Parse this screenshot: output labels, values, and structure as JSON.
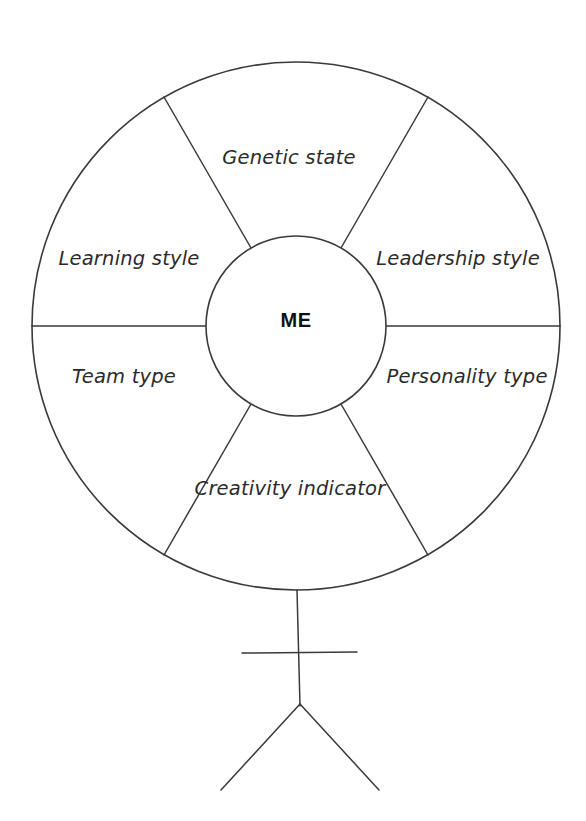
{
  "diagram": {
    "type": "radial-wheel",
    "top_caption": "",
    "center": {
      "label": "ME"
    },
    "sectors": [
      {
        "id": "genetic-state",
        "label": "Genetic state",
        "position": "top",
        "label_x": 289,
        "label_y": 158
      },
      {
        "id": "leadership-style",
        "label": "Leadership style",
        "position": "upper-right",
        "label_x": 458,
        "label_y": 259
      },
      {
        "id": "personality-type",
        "label": "Personality type",
        "position": "lower-right",
        "label_x": 467,
        "label_y": 377
      },
      {
        "id": "creativity-indicator",
        "label": "Creativity indicator",
        "position": "bottom",
        "label_x": 290,
        "label_y": 489
      },
      {
        "id": "team-type",
        "label": "Team type",
        "position": "lower-left",
        "label_x": 124,
        "label_y": 377
      },
      {
        "id": "learning-style",
        "label": "Learning style",
        "position": "upper-left",
        "label_x": 129,
        "label_y": 259
      }
    ],
    "geometry": {
      "outer_circle": {
        "cx": 296,
        "cy": 326,
        "r": 264
      },
      "inner_circle": {
        "cx": 296,
        "cy": 326,
        "r": 90
      },
      "spoke_angles_deg": [
        0,
        60,
        120,
        180,
        240,
        300
      ]
    },
    "figure": {
      "name": "stick-figure-body",
      "torso": {
        "x1": 296,
        "y1": 590,
        "x2": 300,
        "y2": 706
      },
      "arms": {
        "x1": 242,
        "y1": 653,
        "x2": 357,
        "y2": 652
      },
      "leg_left": {
        "x1": 300,
        "y1": 704,
        "x2": 221,
        "y2": 790
      },
      "leg_right": {
        "x1": 300,
        "y1": 704,
        "x2": 379,
        "y2": 790
      }
    },
    "colors": {
      "stroke": "#3a3a3a",
      "text": "#2b2b2b",
      "center_text": "#121212",
      "background": "#ffffff"
    }
  }
}
